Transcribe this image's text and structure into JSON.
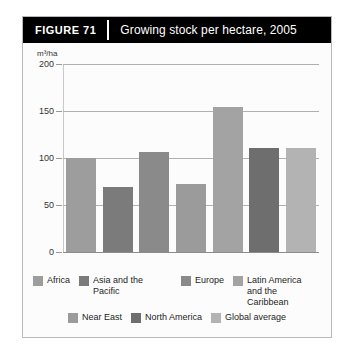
{
  "figure": {
    "number_label": "FIGURE  71",
    "title": "Growing stock per hectare, 2005"
  },
  "chart_data": {
    "type": "bar",
    "title": "Growing stock per hectare, 2005",
    "xlabel": "",
    "ylabel": "m³/ha",
    "ylim": [
      0,
      200
    ],
    "yticks": [
      0,
      50,
      100,
      150,
      200
    ],
    "grid": true,
    "legend_position": "bottom",
    "categories": [
      "Africa",
      "Asia and the Pacific",
      "Europe",
      "Near East",
      "Latin America and the Caribbean",
      "North America",
      "Global average"
    ],
    "values": [
      101,
      70,
      107,
      73,
      155,
      111,
      111
    ],
    "colors": [
      "#9d9d9d",
      "#7b7b7b",
      "#8a8a8a",
      "#9b9b9b",
      "#a3a3a3",
      "#6e6e6e",
      "#b3b3b3"
    ]
  },
  "axis": {
    "unit": "m³/ha",
    "ticks": [
      "200",
      "150",
      "100",
      "50",
      "0"
    ]
  },
  "legend": {
    "rows": [
      [
        {
          "label": "Africa",
          "color": "#9d9d9d"
        },
        {
          "label": "Asia and the Pacific",
          "color": "#7b7b7b"
        },
        {
          "label": "Europe",
          "color": "#8a8a8a"
        },
        {
          "label": "Latin America\nand the Caribbean",
          "color": "#a3a3a3"
        }
      ],
      [
        {
          "label": "Near East",
          "color": "#9b9b9b"
        },
        {
          "label": "North America",
          "color": "#6e6e6e"
        },
        {
          "label": "Global average",
          "color": "#b3b3b3"
        }
      ]
    ]
  }
}
